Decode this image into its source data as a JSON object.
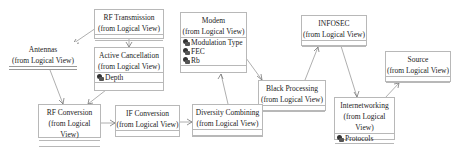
{
  "diagram": {
    "type": "UML class diagram",
    "classes": [
      {
        "id": "rf_transmission",
        "name": "RF Transmission",
        "package": "(from Logical View)",
        "attributes": []
      },
      {
        "id": "active_cancellation",
        "name": "Active Cancellation",
        "package": "(from Logical View)",
        "attributes": [
          "Depth"
        ]
      },
      {
        "id": "antennas",
        "name": "Antennas",
        "package": "(from Logical View)",
        "attributes": []
      },
      {
        "id": "modem",
        "name": "Modem",
        "package": "(from Logical View)",
        "attributes": [
          "Modulation Type",
          "FEC",
          "Rb"
        ]
      },
      {
        "id": "black_processing",
        "name": "Black Processing",
        "package": "(from Logical View)",
        "attributes": []
      },
      {
        "id": "infosec",
        "name": "INFOSEC",
        "package": "(from Logical View)",
        "attributes": []
      },
      {
        "id": "source",
        "name": "Source",
        "package": "(from Logical View)",
        "attributes": []
      },
      {
        "id": "internetworking",
        "name": "Internetworking",
        "package": "(from Logical View)",
        "attributes": [
          "Protocols"
        ]
      },
      {
        "id": "rf_conversion",
        "name": "RF Conversion",
        "package": "(from Logical View)",
        "attributes": []
      },
      {
        "id": "if_conversion",
        "name": "IF Conversion",
        "package": "(from Logical View)",
        "attributes": []
      },
      {
        "id": "diversity_combining",
        "name": "Diversity Combining",
        "package": "(from Logical View)",
        "attributes": []
      }
    ],
    "relations": [
      {
        "from": "rf_transmission",
        "to": "antennas"
      },
      {
        "from": "rf_transmission",
        "to": "active_cancellation"
      },
      {
        "from": "antennas",
        "to": "rf_conversion"
      },
      {
        "from": "active_cancellation",
        "to": "rf_conversion"
      },
      {
        "from": "rf_conversion",
        "to": "if_conversion"
      },
      {
        "from": "if_conversion",
        "to": "diversity_combining"
      },
      {
        "from": "diversity_combining",
        "to": "modem"
      },
      {
        "from": "modem",
        "to": "black_processing"
      },
      {
        "from": "black_processing",
        "to": "infosec"
      },
      {
        "from": "infosec",
        "to": "internetworking"
      },
      {
        "from": "internetworking",
        "to": "source"
      }
    ],
    "colors": {
      "border": "#b8b8b8",
      "edge": "#9a9a9a",
      "text": "#222222",
      "background": "#ffffff"
    }
  }
}
